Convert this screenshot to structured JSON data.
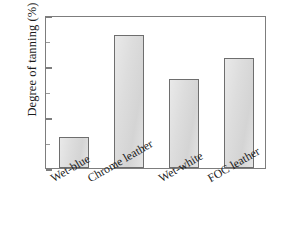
{
  "chart_data": {
    "type": "bar",
    "title": "",
    "xlabel": "",
    "ylabel": "Degree of tanning (%)",
    "categories": [
      "Wet-blue",
      "Chrome leather",
      "Wet-white",
      "FOC leather"
    ],
    "values": [
      12,
      52,
      35,
      43
    ],
    "ylim": [
      0,
      60
    ],
    "ytick_labels": [
      "0",
      "20",
      "40",
      "60"
    ],
    "ytick_values": [
      0,
      20,
      40,
      60
    ],
    "yminor_tick_values": [
      10,
      30,
      50
    ],
    "grid": false,
    "legend": null,
    "colors": {
      "bar_fill": "#dcdcdc",
      "bar_edge": "#6e6e6e",
      "axis": "#7d7d7d",
      "text": "#1b1b1b",
      "background": "#ffffff"
    }
  }
}
